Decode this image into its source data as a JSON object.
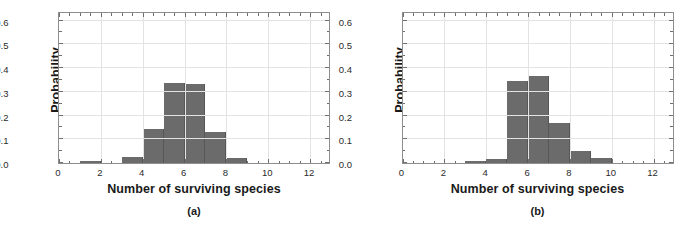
{
  "figure": {
    "background": "#ffffff",
    "bar_color": "#6b6b6b",
    "grid_color": "#e3e3e3",
    "axis_color": "#8e8e8e"
  },
  "chart_data": [
    {
      "type": "bar",
      "panel": "a",
      "caption": "(a)",
      "title": "",
      "xlabel": "Number of surviving species",
      "ylabel": "Probability",
      "xlim": [
        0,
        13
      ],
      "ylim": [
        0,
        0.64
      ],
      "grid": true,
      "legend": "none",
      "xticks": [
        0,
        2,
        4,
        6,
        8,
        10,
        12
      ],
      "xticklabels": [
        "0",
        "2",
        "4",
        "6",
        "8",
        "10",
        "12"
      ],
      "yticks": [
        0.0,
        0.1,
        0.2,
        0.3,
        0.4,
        0.5,
        0.6
      ],
      "yticklabels": [
        "0.0",
        "0.1",
        "0.2",
        "0.3",
        "0.4",
        "0.5",
        "0.6"
      ],
      "bin_edges": [
        1,
        2,
        3,
        4,
        5,
        6,
        7,
        8,
        9
      ],
      "categories": [
        "1",
        "2",
        "3",
        "4",
        "5",
        "6",
        "7",
        "8"
      ],
      "values": [
        0.007,
        0.0,
        0.026,
        0.143,
        0.335,
        0.332,
        0.131,
        0.021
      ]
    },
    {
      "type": "bar",
      "panel": "b",
      "caption": "(b)",
      "title": "",
      "xlabel": "Number of surviving species",
      "ylabel": "Probability",
      "xlim": [
        0,
        13
      ],
      "ylim": [
        0,
        0.64
      ],
      "grid": true,
      "legend": "none",
      "xticks": [
        0,
        2,
        4,
        6,
        8,
        10,
        12
      ],
      "xticklabels": [
        "0",
        "2",
        "4",
        "6",
        "8",
        "10",
        "12"
      ],
      "yticks": [
        0.0,
        0.1,
        0.2,
        0.3,
        0.4,
        0.5,
        0.6
      ],
      "yticklabels": [
        "0.0",
        "0.1",
        "0.2",
        "0.3",
        "0.4",
        "0.5",
        "0.6"
      ],
      "bin_edges": [
        3,
        4,
        5,
        6,
        7,
        8,
        9,
        10
      ],
      "categories": [
        "3",
        "4",
        "5",
        "6",
        "7",
        "8",
        "9"
      ],
      "values": [
        0.01,
        0.017,
        0.346,
        0.365,
        0.167,
        0.052,
        0.023
      ]
    }
  ]
}
